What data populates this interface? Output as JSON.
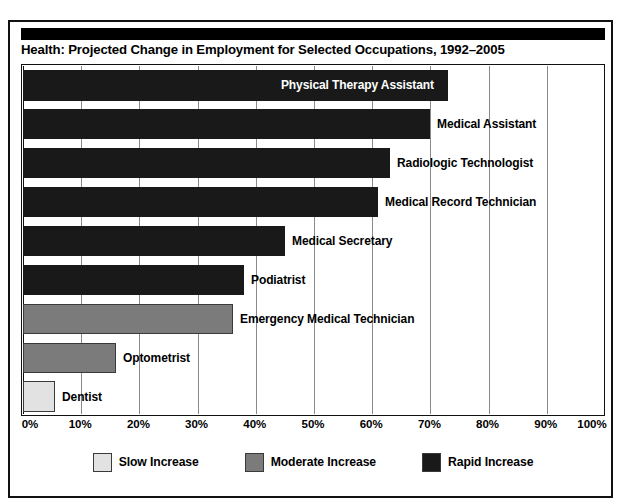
{
  "figure": {
    "title": "Health: Projected Change in Employment for Selected Occupations, 1992–2005"
  },
  "chart_data": {
    "type": "bar",
    "orientation": "horizontal",
    "title": "Health: Projected Change in Employment for Selected Occupations, 1992–2005",
    "xlabel": "",
    "ylabel": "",
    "xlim": [
      0,
      100
    ],
    "xtick_labels": [
      "0%",
      "10%",
      "20%",
      "30%",
      "40%",
      "50%",
      "60%",
      "70%",
      "80%",
      "90%",
      "100%"
    ],
    "xticks": [
      0,
      10,
      20,
      30,
      40,
      50,
      60,
      70,
      80,
      90,
      100
    ],
    "grid": true,
    "legend_position": "bottom",
    "categories": [
      "Physical Therapy Assistant",
      "Medical Assistant",
      "Radiologic Technologist",
      "Medical Record Technician",
      "Medical Secretary",
      "Podiatrist",
      "Emergency Medical Technician",
      "Optometrist",
      "Dentist"
    ],
    "values": [
      93,
      70,
      63,
      61,
      45,
      38,
      36,
      16,
      5.5
    ],
    "bar_categories": [
      "rapid",
      "rapid",
      "rapid",
      "rapid",
      "rapid",
      "rapid",
      "moderate",
      "moderate",
      "slow"
    ],
    "label_placement": [
      "inside",
      "outside",
      "outside",
      "outside",
      "outside",
      "outside",
      "outside",
      "outside",
      "outside"
    ],
    "legend": [
      {
        "key": "slow",
        "label": "Slow Increase",
        "color": "#e2e2e2"
      },
      {
        "key": "moderate",
        "label": "Moderate Increase",
        "color": "#7b7b7b"
      },
      {
        "key": "rapid",
        "label": "Rapid Increase",
        "color": "#191919"
      }
    ]
  }
}
